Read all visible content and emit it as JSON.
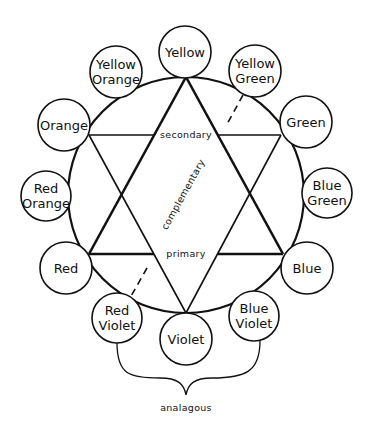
{
  "diagram": {
    "colors": {
      "stroke": "#111111",
      "background": "#ffffff"
    },
    "wheel": {
      "cx": 186,
      "cy": 195,
      "r": 118
    },
    "nodes": [
      {
        "id": "yellow",
        "lines": [
          "Yellow"
        ],
        "cx": 185,
        "cy": 52,
        "r": 26
      },
      {
        "id": "yellow-green",
        "lines": [
          "Yellow",
          "Green"
        ],
        "cx": 255,
        "cy": 71,
        "r": 26
      },
      {
        "id": "green",
        "lines": [
          "Green"
        ],
        "cx": 306,
        "cy": 122,
        "r": 26
      },
      {
        "id": "blue-green",
        "lines": [
          "Blue",
          "Green"
        ],
        "cx": 327,
        "cy": 193,
        "r": 25
      },
      {
        "id": "blue",
        "lines": [
          "Blue"
        ],
        "cx": 307,
        "cy": 268,
        "r": 26
      },
      {
        "id": "blue-violet",
        "lines": [
          "Blue",
          "Violet"
        ],
        "cx": 254,
        "cy": 316,
        "r": 25
      },
      {
        "id": "violet",
        "lines": [
          "Violet"
        ],
        "cx": 186,
        "cy": 339,
        "r": 26
      },
      {
        "id": "red-violet",
        "lines": [
          "Red",
          "Violet"
        ],
        "cx": 117,
        "cy": 318,
        "r": 25
      },
      {
        "id": "red",
        "lines": [
          "Red"
        ],
        "cx": 66,
        "cy": 268,
        "r": 26
      },
      {
        "id": "red-orange",
        "lines": [
          "Red",
          "Orange"
        ],
        "cx": 46,
        "cy": 196,
        "r": 25
      },
      {
        "id": "orange",
        "lines": [
          "Orange"
        ],
        "cx": 64,
        "cy": 125,
        "r": 26
      },
      {
        "id": "yellow-orange",
        "lines": [
          "Yellow",
          "Orange"
        ],
        "cx": 116,
        "cy": 72,
        "r": 26
      }
    ],
    "labels": {
      "secondary": "secondary",
      "primary": "primary",
      "complementary": "complementary",
      "analagous": "analagous"
    },
    "primary_triangle": [
      [
        186,
        77
      ],
      [
        89,
        254
      ],
      [
        283,
        254
      ]
    ],
    "secondary_triangle": [
      [
        89,
        135
      ],
      [
        281,
        135
      ],
      [
        186,
        313
      ]
    ],
    "complementary_line": {
      "from": [
        243,
        95
      ],
      "to": [
        130,
        298
      ]
    }
  }
}
